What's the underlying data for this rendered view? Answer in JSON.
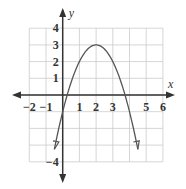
{
  "chart_data": {
    "type": "line",
    "title": "",
    "xlabel": "x",
    "ylabel": "y",
    "xlim": [
      -2.5,
      6.5
    ],
    "ylim": [
      -4.5,
      4.5
    ],
    "grid": true,
    "x_ticks": [
      -2,
      -1,
      1,
      2,
      3,
      5,
      6
    ],
    "x_tick_labels": [
      "−2",
      "−1",
      "1",
      "2",
      "3",
      "5",
      "6"
    ],
    "y_ticks": [
      4,
      3,
      2,
      1,
      -4
    ],
    "y_tick_labels": [
      "4",
      "3",
      "2",
      "1",
      "−4"
    ],
    "series": [
      {
        "name": "y = -(x-2)^2 + 3",
        "function": "-(x-2)^2+3",
        "x_range": [
          -0.5,
          4.5
        ],
        "vertex": [
          2,
          3
        ],
        "x_intercepts": [
          0.27,
          3.73
        ],
        "y_intercept": -1,
        "arrows_at_ends": true
      }
    ],
    "colors": {
      "axis": "#333333",
      "grid": "#cccccc",
      "curve": "#555555"
    }
  }
}
